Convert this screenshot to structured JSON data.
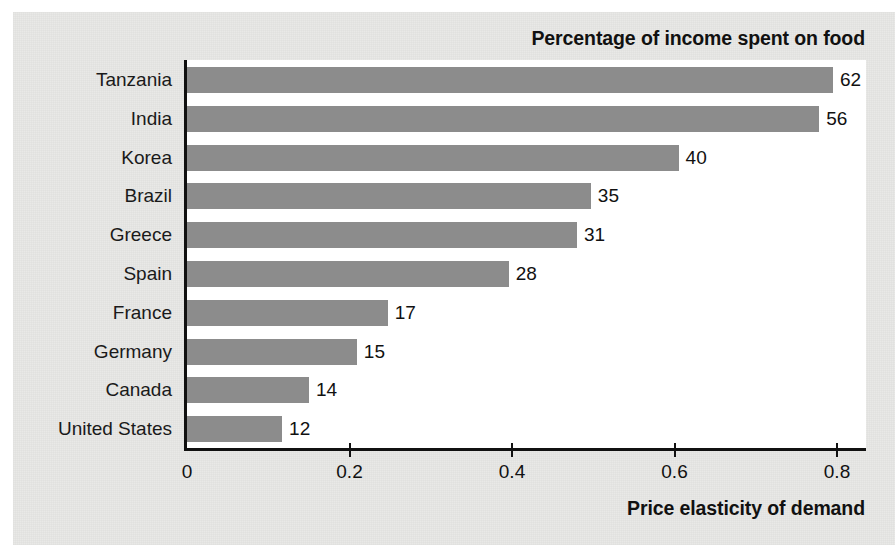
{
  "chart_data": {
    "type": "bar",
    "orientation": "horizontal",
    "title": "Percentage of income spent on food",
    "xlabel": "Price elasticity of demand",
    "ylabel": "",
    "xlim": [
      0,
      0.8368
    ],
    "xticks": [
      0,
      0.2,
      0.4,
      0.6,
      0.8
    ],
    "xtick_labels": [
      "0",
      "0.2",
      "0.4",
      "0.6",
      "0.8"
    ],
    "grid": false,
    "legend": "none",
    "bar_color": "#8c8c8c",
    "axis_color": "#111111",
    "plot_background": "#ffffff",
    "panel_background": "#e9e9e7",
    "categories": [
      "Tanzania",
      "India",
      "Korea",
      "Brazil",
      "Greece",
      "Spain",
      "France",
      "Germany",
      "Canada",
      "United States"
    ],
    "values": [
      0.795,
      0.778,
      0.605,
      0.497,
      0.48,
      0.396,
      0.247,
      0.209,
      0.15,
      0.117
    ],
    "data_labels": [
      "62",
      "56",
      "40",
      "35",
      "31",
      "28",
      "17",
      "15",
      "14",
      "12"
    ],
    "data_label_meaning": "Percentage of income spent on food",
    "rows": [
      {
        "category": "Tanzania",
        "elasticity": 0.795,
        "percent_income_food": "62"
      },
      {
        "category": "India",
        "elasticity": 0.778,
        "percent_income_food": "56"
      },
      {
        "category": "Korea",
        "elasticity": 0.605,
        "percent_income_food": "40"
      },
      {
        "category": "Brazil",
        "elasticity": 0.497,
        "percent_income_food": "35"
      },
      {
        "category": "Greece",
        "elasticity": 0.48,
        "percent_income_food": "31"
      },
      {
        "category": "Spain",
        "elasticity": 0.396,
        "percent_income_food": "28"
      },
      {
        "category": "France",
        "elasticity": 0.247,
        "percent_income_food": "17"
      },
      {
        "category": "Germany",
        "elasticity": 0.209,
        "percent_income_food": "15"
      },
      {
        "category": "Canada",
        "elasticity": 0.15,
        "percent_income_food": "14"
      },
      {
        "category": "United States",
        "elasticity": 0.117,
        "percent_income_food": "12"
      }
    ]
  }
}
